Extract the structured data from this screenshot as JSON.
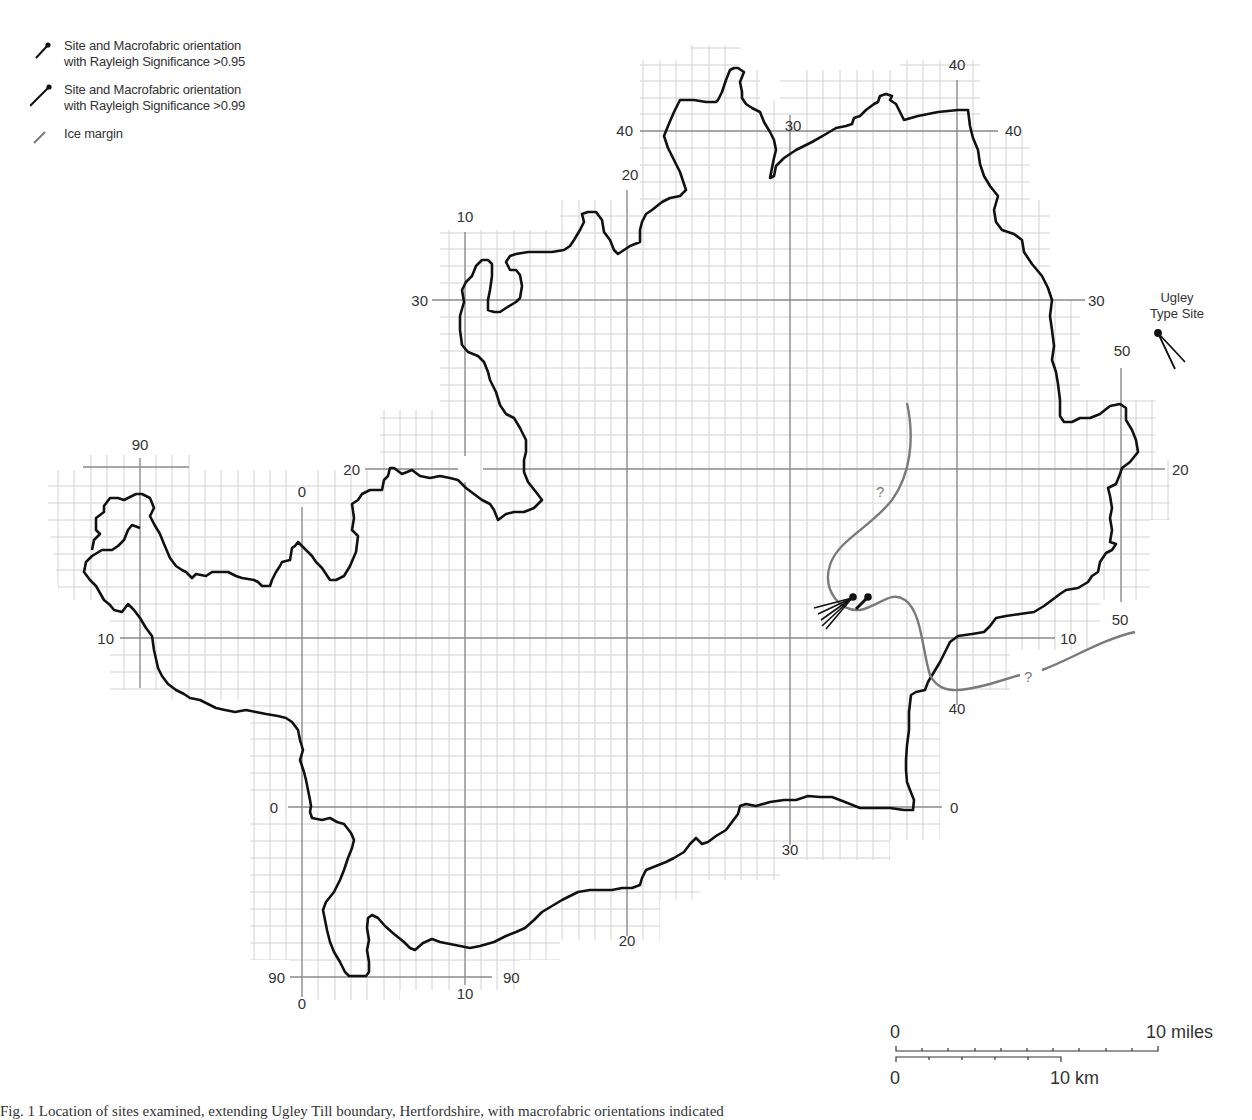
{
  "legend": {
    "items": [
      {
        "symbol": "site-095-icon",
        "label": "Site and Macrofabric orientation\nwith Rayleigh Significance >0.95"
      },
      {
        "symbol": "site-099-icon",
        "label": "Site and Macrofabric orientation\nwith Rayleigh Significance >0.99"
      },
      {
        "symbol": "ice-margin-icon",
        "label": "Ice margin"
      }
    ]
  },
  "colors": {
    "outline": "#111111",
    "grid_major": "#8a8a8a",
    "grid_minor": "#cfcfcf",
    "ice_margin": "#7a7a7a",
    "text": "#333333"
  },
  "grid_labels": {
    "top": [
      {
        "text": "10",
        "x": 465,
        "y": 222
      },
      {
        "text": "20",
        "x": 630,
        "y": 180
      },
      {
        "text": "30",
        "x": 793,
        "y": 131
      },
      {
        "text": "40",
        "x": 957,
        "y": 70
      }
    ],
    "left": [
      {
        "text": "40",
        "x": 625,
        "y": 136
      },
      {
        "text": "30",
        "x": 420,
        "y": 306
      },
      {
        "text": "20",
        "x": 352,
        "y": 475
      },
      {
        "text": "10",
        "x": 106,
        "y": 644
      },
      {
        "text": "0",
        "x": 270,
        "y": 813
      },
      {
        "text": "90",
        "x": 277,
        "y": 983
      }
    ],
    "right": [
      {
        "text": "40",
        "x": 1015,
        "y": 136
      },
      {
        "text": "30",
        "x": 1097,
        "y": 306
      },
      {
        "text": "20",
        "x": 1182,
        "y": 475
      },
      {
        "text": "10",
        "x": 1070,
        "y": 644
      },
      {
        "text": "0",
        "x": 955,
        "y": 813
      },
      {
        "text": "90",
        "x": 512,
        "y": 983
      }
    ],
    "vertical_extra": [
      {
        "text": "90",
        "x": 140,
        "y": 450
      },
      {
        "text": "0",
        "x": 302,
        "y": 497
      },
      {
        "text": "50",
        "x": 1122,
        "y": 356
      },
      {
        "text": "50",
        "x": 1120,
        "y": 625
      },
      {
        "text": "40",
        "x": 957,
        "y": 714
      },
      {
        "text": "30",
        "x": 790,
        "y": 855
      },
      {
        "text": "20",
        "x": 627,
        "y": 946
      },
      {
        "text": "10",
        "x": 465,
        "y": 999
      },
      {
        "text": "0",
        "x": 302,
        "y": 1009
      }
    ]
  },
  "ugley": {
    "label": "Ugley\nType Site"
  },
  "ice_margin_marks": [
    "?",
    "?"
  ],
  "scale": {
    "miles_start": "0",
    "miles_end": "10 miles",
    "km_start": "0",
    "km_end": "10 km"
  },
  "caption": "Fig. 1   Location of sites examined, extending Ugley Till boundary, Hertfordshire, with macrofabric orientations indicated"
}
